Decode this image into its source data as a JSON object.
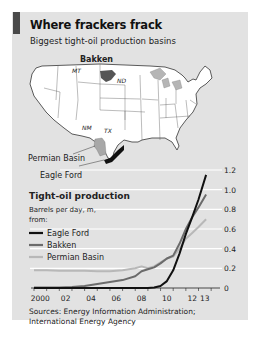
{
  "header": {
    "title": "Where frackers frack",
    "subtitle": "Biggest tight-oil production basins"
  },
  "map": {
    "labels": {
      "bakken": "Bakken",
      "mt": "MT",
      "nd": "ND",
      "nm": "NM",
      "tx": "TX",
      "permian": "Permian Basin",
      "eagle_ford": "Eagle Ford"
    }
  },
  "legend": {
    "title": "Tight-oil production",
    "units_line1": "Barrels per day, m,",
    "units_line2": "from:",
    "items": [
      {
        "name": "Eagle Ford",
        "color": "#111111"
      },
      {
        "name": "Bakken",
        "color": "#6b6b6b"
      },
      {
        "name": "Permian Basin",
        "color": "#b8b8b8"
      }
    ]
  },
  "sources": {
    "line1": "Sources: Energy Information Administration;",
    "line2": "International Energy Agency"
  },
  "chart_data": {
    "type": "line",
    "title": "Tight-oil production",
    "ylabel": "Barrels per day, m",
    "xlabel": "",
    "xlim": [
      2000,
      2013.75
    ],
    "ylim": [
      0,
      1.2
    ],
    "y_ticks": [
      0,
      0.2,
      0.4,
      0.6,
      0.8,
      1.0,
      1.2
    ],
    "y_tick_labels": [
      "0",
      "0.2",
      "0.4",
      "0.6",
      "0.8",
      "1.0",
      "1.2"
    ],
    "x_ticks": [
      2000,
      2002,
      2004,
      2006,
      2008,
      2010,
      2012,
      2013
    ],
    "x_tick_labels": [
      "2000",
      "02",
      "04",
      "06",
      "08",
      "10",
      "12",
      "13"
    ],
    "grid": true,
    "legend_position": "left",
    "series": [
      {
        "name": "Permian Basin",
        "x": [
          2000,
          2001,
          2002,
          2003,
          2004,
          2005,
          2006,
          2007,
          2008,
          2008.5,
          2009,
          2009.5,
          2010,
          2010.5,
          2011,
          2011.5,
          2012,
          2012.5,
          2013,
          2013.6
        ],
        "values": [
          0.18,
          0.18,
          0.175,
          0.175,
          0.175,
          0.17,
          0.17,
          0.18,
          0.2,
          0.22,
          0.2,
          0.22,
          0.26,
          0.3,
          0.32,
          0.4,
          0.5,
          0.56,
          0.62,
          0.7
        ]
      },
      {
        "name": "Bakken",
        "x": [
          2000,
          2001,
          2002,
          2003,
          2004,
          2005,
          2006,
          2007,
          2008,
          2008.5,
          2009,
          2009.5,
          2010,
          2010.5,
          2011,
          2011.5,
          2012,
          2012.5,
          2013,
          2013.6
        ],
        "values": [
          0.005,
          0.005,
          0.005,
          0.01,
          0.02,
          0.04,
          0.06,
          0.08,
          0.12,
          0.17,
          0.19,
          0.21,
          0.25,
          0.3,
          0.33,
          0.45,
          0.6,
          0.72,
          0.82,
          0.95
        ]
      },
      {
        "name": "Eagle Ford",
        "x": [
          2000,
          2002,
          2004,
          2006,
          2008,
          2009,
          2009.5,
          2010,
          2010.5,
          2011,
          2011.5,
          2012,
          2012.5,
          2013,
          2013.6
        ],
        "values": [
          0,
          0,
          0,
          0,
          0,
          0,
          0.005,
          0.02,
          0.07,
          0.18,
          0.35,
          0.55,
          0.72,
          0.9,
          1.15
        ]
      }
    ]
  }
}
